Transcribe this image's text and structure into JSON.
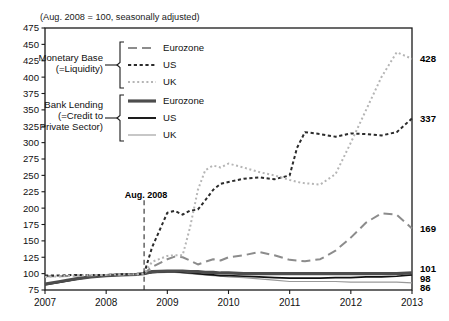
{
  "figure": {
    "note": "(Aug. 2008 = 100, seasonally adjusted)",
    "background_color": "#ffffff",
    "frame_color": "#1a1a1a"
  },
  "annotations": [
    {
      "name": "aug-2008-marker",
      "label": "Aug. 2008",
      "x_value": 2008.62,
      "style": "dashed-vertical-line"
    }
  ],
  "legend": {
    "groups": [
      {
        "name": "monetary-base",
        "title_line1": "Monetary Base",
        "title_line2": "(=Liquidity)",
        "entries": [
          {
            "label": "Eurozone",
            "series_key": "mb_eurozone",
            "dash": "long-dash",
            "color": "#8c8c8c"
          },
          {
            "label": "US",
            "series_key": "mb_us",
            "dash": "short-dash",
            "color": "#2b2b2b"
          },
          {
            "label": "UK",
            "series_key": "mb_uk",
            "dash": "dotted",
            "color": "#b5b5b5"
          }
        ]
      },
      {
        "name": "bank-lending",
        "title_line1": "Bank Lending",
        "title_line2": "(=Credit to",
        "title_line3": "Private Sector)",
        "entries": [
          {
            "label": "Eurozone",
            "series_key": "bl_eurozone",
            "dash": "solid-thick",
            "color": "#4d4d4d"
          },
          {
            "label": "US",
            "series_key": "bl_us",
            "dash": "solid-medium",
            "color": "#111111"
          },
          {
            "label": "UK",
            "series_key": "bl_uk",
            "dash": "solid-thin",
            "color": "#999999"
          }
        ]
      }
    ]
  },
  "chart_data": {
    "type": "line",
    "title": "",
    "subtitle": "(Aug. 2008 = 100, seasonally adjusted)",
    "xlabel": "",
    "ylabel": "",
    "xlim": [
      2007.0,
      2013.0
    ],
    "ylim": [
      75,
      475
    ],
    "ytick_step": 25,
    "grid": false,
    "legend_position": "upper-left-inside",
    "yticks": [
      75,
      100,
      125,
      150,
      175,
      200,
      225,
      250,
      275,
      300,
      325,
      350,
      375,
      400,
      425,
      450,
      475
    ],
    "xticks": [
      2007,
      2008,
      2009,
      2010,
      2011,
      2012,
      2013
    ],
    "xticklabels": [
      "2007",
      "2008",
      "2009",
      "2010",
      "2011",
      "2012",
      "2013"
    ],
    "end_labels": [
      {
        "series_key": "mb_uk",
        "value": 428,
        "text": "428"
      },
      {
        "series_key": "mb_us",
        "value": 337,
        "text": "337"
      },
      {
        "series_key": "mb_eurozone",
        "value": 169,
        "text": "169"
      },
      {
        "series_key": "bl_eurozone",
        "value": 101,
        "text": "101"
      },
      {
        "series_key": "bl_us",
        "value": 98,
        "text": "98"
      },
      {
        "series_key": "bl_uk",
        "value": 86,
        "text": "86"
      }
    ],
    "x": [
      2007.0,
      2007.25,
      2007.5,
      2007.75,
      2008.0,
      2008.25,
      2008.5,
      2008.62,
      2008.75,
      2009.0,
      2009.12,
      2009.25,
      2009.37,
      2009.5,
      2009.62,
      2009.75,
      2009.87,
      2010.0,
      2010.25,
      2010.5,
      2010.75,
      2011.0,
      2011.12,
      2011.25,
      2011.5,
      2011.75,
      2012.0,
      2012.25,
      2012.5,
      2012.75,
      2013.0
    ],
    "series": [
      {
        "key": "mb_eurozone",
        "name": "Eurozone",
        "group": "Monetary Base (=Liquidity)",
        "color": "#8c8c8c",
        "dash": "long-dash",
        "width": 2.0,
        "values": [
          96,
          96,
          97,
          97,
          98,
          98,
          99,
          100,
          110,
          122,
          126,
          125,
          120,
          114,
          118,
          122,
          120,
          125,
          128,
          133,
          128,
          121,
          120,
          119,
          122,
          135,
          155,
          178,
          192,
          190,
          169
        ]
      },
      {
        "key": "mb_us",
        "name": "US",
        "group": "Monetary Base (=Liquidity)",
        "color": "#2b2b2b",
        "dash": "short-dash",
        "width": 2.0,
        "values": [
          97,
          97,
          98,
          98,
          98,
          99,
          99,
          100,
          140,
          193,
          196,
          190,
          196,
          198,
          212,
          228,
          237,
          240,
          245,
          247,
          244,
          250,
          292,
          316,
          313,
          309,
          314,
          313,
          311,
          316,
          337
        ]
      },
      {
        "key": "mb_uk",
        "name": "UK",
        "group": "Monetary Base (=Liquidity)",
        "color": "#b5b5b5",
        "dash": "dotted",
        "width": 2.0,
        "values": [
          95,
          96,
          97,
          98,
          98,
          99,
          99,
          100,
          118,
          127,
          128,
          128,
          170,
          228,
          258,
          265,
          262,
          268,
          262,
          255,
          250,
          243,
          240,
          238,
          236,
          252,
          300,
          350,
          400,
          438,
          428
        ]
      },
      {
        "key": "bl_eurozone",
        "name": "Eurozone",
        "group": "Bank Lending (=Credit to Private Sector)",
        "color": "#4d4d4d",
        "dash": "solid-thick",
        "width": 3.2,
        "values": [
          84,
          88,
          92,
          95,
          97,
          98,
          99,
          100,
          103,
          104,
          104,
          104,
          103,
          103,
          102,
          102,
          101,
          101,
          100,
          100,
          100,
          100,
          100,
          100,
          100,
          100,
          100,
          100,
          100,
          100,
          101
        ]
      },
      {
        "key": "bl_us",
        "name": "US",
        "group": "Bank Lending (=Credit to Private Sector)",
        "color": "#111111",
        "dash": "solid-medium",
        "width": 1.7,
        "values": [
          83,
          87,
          91,
          95,
          97,
          98,
          99,
          100,
          102,
          103,
          103,
          102,
          101,
          100,
          99,
          98,
          97,
          97,
          96,
          95,
          94,
          93,
          93,
          93,
          93,
          94,
          94,
          95,
          95,
          96,
          98
        ]
      },
      {
        "key": "bl_uk",
        "name": "UK",
        "group": "Bank Lending (=Credit to Private Sector)",
        "color": "#999999",
        "dash": "solid-thin",
        "width": 1.2,
        "values": [
          83,
          87,
          91,
          95,
          97,
          98,
          99,
          100,
          101,
          102,
          102,
          101,
          100,
          99,
          98,
          97,
          96,
          95,
          94,
          92,
          90,
          88,
          88,
          88,
          88,
          88,
          87,
          87,
          87,
          87,
          86
        ]
      }
    ]
  }
}
